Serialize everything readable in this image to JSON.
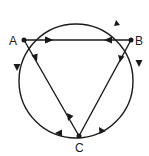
{
  "diagram": {
    "type": "directed-graph-on-circle",
    "stroke_color": "#1a1a1a",
    "background": "#ffffff",
    "circle": {
      "cx": 76,
      "cy": 81,
      "r": 57
    },
    "nodes": [
      {
        "id": "A",
        "label": "A",
        "x": 24,
        "y": 40
      },
      {
        "id": "B",
        "label": "B",
        "x": 131,
        "y": 40
      },
      {
        "id": "C",
        "label": "C",
        "x": 79,
        "y": 136
      }
    ],
    "chord_edges": [
      {
        "from": "A",
        "to": "B",
        "arrow_near": "A"
      },
      {
        "from": "B",
        "to": "A",
        "arrow_near": "B"
      },
      {
        "from": "A",
        "to": "C",
        "arrow_near": "A"
      },
      {
        "from": "C",
        "to": "A",
        "arrow_near": "C"
      },
      {
        "from": "B",
        "to": "C",
        "arrow_near": "B"
      }
    ],
    "arc_edges": [
      {
        "from": "B",
        "to": "A",
        "path": "top arc"
      },
      {
        "from": "A",
        "to": "C",
        "path": "left arc"
      },
      {
        "from": "C",
        "to": "A",
        "path": "bottom-left arc"
      },
      {
        "from": "B",
        "to": "C",
        "path": "right arc"
      },
      {
        "from": "C",
        "to": "B",
        "path": "bottom-right arc"
      }
    ]
  }
}
